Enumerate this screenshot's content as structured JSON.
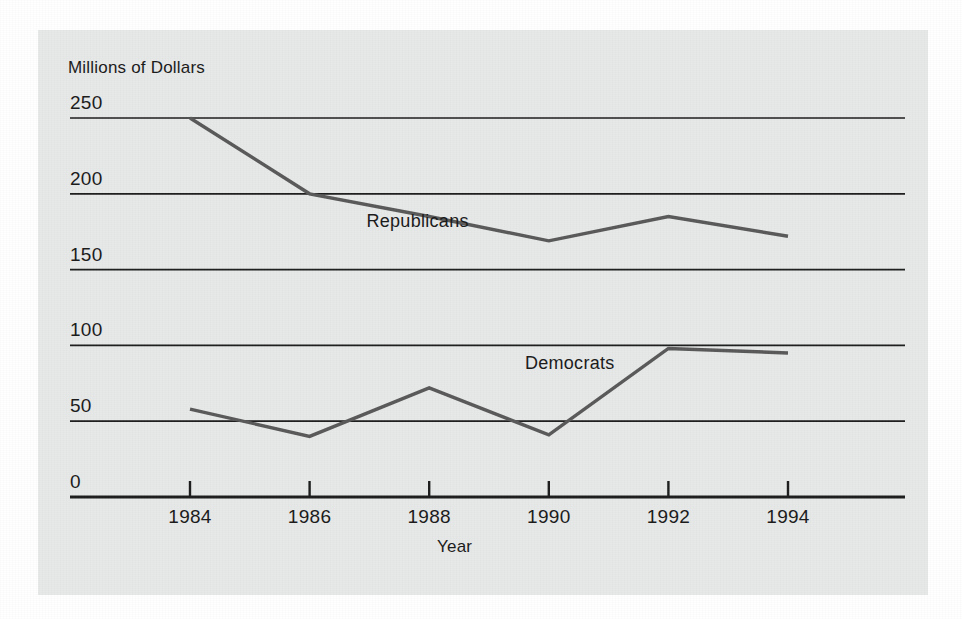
{
  "chart_data": {
    "type": "line",
    "title": "",
    "xlabel": "Year",
    "ylabel": "Millions of Dollars",
    "x": [
      1984,
      1986,
      1988,
      1990,
      1992,
      1994
    ],
    "xtick_labels": [
      "1984",
      "1986",
      "1988",
      "1990",
      "1992",
      "1994"
    ],
    "ytick_labels": [
      "0",
      "50",
      "100",
      "150",
      "200",
      "250"
    ],
    "yticks": [
      0,
      50,
      100,
      150,
      200,
      250
    ],
    "xlim": [
      1983,
      1995.2
    ],
    "ylim": [
      0,
      250
    ],
    "grid": "horizontal",
    "legend": "inline-labels",
    "series": [
      {
        "name": "Republicans",
        "values": [
          250,
          200,
          185,
          169,
          185,
          172
        ],
        "color": "#595959",
        "label_x": 1986.95,
        "label_y": 181
      },
      {
        "name": "Democrats",
        "values": [
          58,
          40,
          72,
          41,
          98,
          95
        ],
        "color": "#595959",
        "label_x": 1989.6,
        "label_y": 87
      }
    ]
  },
  "figure": {
    "panel_color": "#e7e8e8",
    "background_color": "#ffffff",
    "line_color": "#595959",
    "axis_color": "#1c1c1c",
    "text_color": "#1c1c1c"
  },
  "labels": {
    "y_axis_title": "Millions of Dollars",
    "x_axis_title": "Year",
    "series_republicans": "Republicans",
    "series_democrats": "Democrats",
    "ytick_250": "250",
    "ytick_200": "200",
    "ytick_150": "150",
    "ytick_100": "100",
    "ytick_50": "50",
    "ytick_0": "0",
    "xtick_1984": "1984",
    "xtick_1986": "1986",
    "xtick_1988": "1988",
    "xtick_1990": "1990",
    "xtick_1992": "1992",
    "xtick_1994": "1994"
  }
}
